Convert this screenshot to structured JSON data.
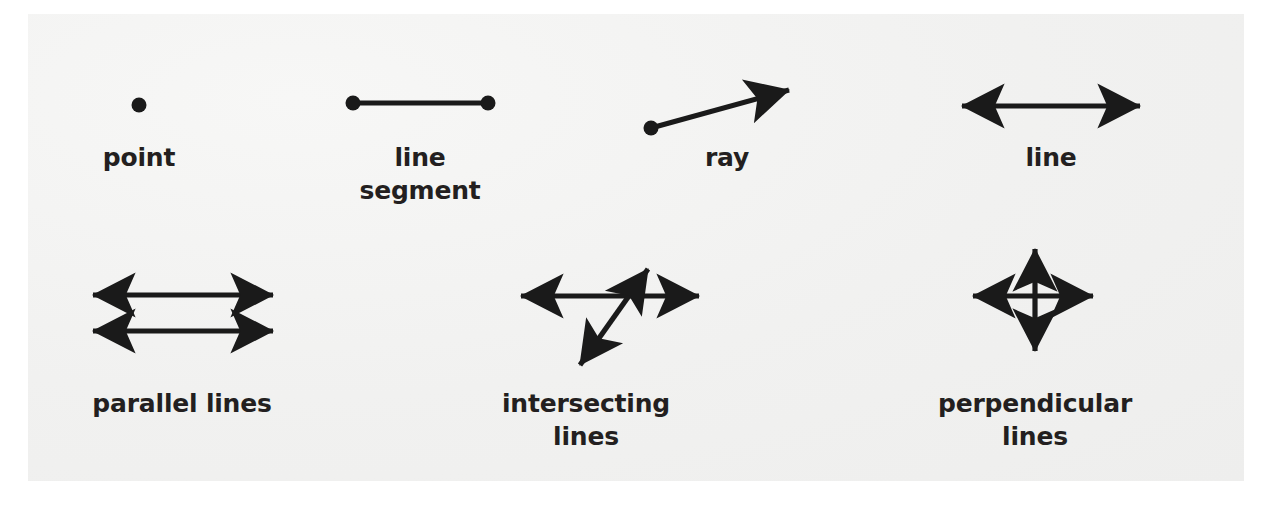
{
  "figure": {
    "background_color": "#f3f3f2",
    "page_color": "#ffffff",
    "ink_color": "#1a1a1a",
    "label_color": "#231f20"
  },
  "items": [
    {
      "id": "point",
      "label_lines": [
        "point"
      ],
      "label_center_x": 139,
      "label_top_y": 144,
      "glyph": "single-dot",
      "dot": {
        "cx": 139,
        "cy": 105,
        "r": 7.5
      }
    },
    {
      "id": "line-segment",
      "label_lines": [
        "line",
        "segment"
      ],
      "label_center_x": 420,
      "label_top_y": 144,
      "glyph": "segment-with-two-endpoints",
      "segment": {
        "x1": 353,
        "y1": 103,
        "x2": 488,
        "y2": 103
      },
      "endpoint_r": 7.5
    },
    {
      "id": "ray",
      "label_lines": [
        "ray"
      ],
      "label_center_x": 727,
      "label_top_y": 144,
      "glyph": "ray-with-one-arrow",
      "segment": {
        "x1": 651,
        "y1": 128,
        "x2": 803,
        "y2": 86
      },
      "endpoint_r": 7.5
    },
    {
      "id": "line",
      "label_lines": [
        "line"
      ],
      "label_center_x": 1051,
      "label_top_y": 144,
      "glyph": "double-arrow-horizontal",
      "segment": {
        "x1": 949,
        "y1": 106,
        "x2": 1153,
        "y2": 106
      }
    },
    {
      "id": "parallel-lines",
      "label_lines": [
        "parallel lines"
      ],
      "label_center_x": 182,
      "label_top_y": 390,
      "glyph": "two-parallel-double-arrows",
      "segments": [
        {
          "x1": 80,
          "y1": 295,
          "x2": 286,
          "y2": 295
        },
        {
          "x1": 80,
          "y1": 331,
          "x2": 286,
          "y2": 331
        }
      ]
    },
    {
      "id": "intersecting-lines",
      "label_lines": [
        "intersecting",
        "lines"
      ],
      "label_center_x": 586,
      "label_top_y": 390,
      "glyph": "two-crossing-double-arrows",
      "segments": [
        {
          "x1": 508,
          "y1": 296,
          "x2": 712,
          "y2": 296
        },
        {
          "x1": 571,
          "y1": 378,
          "x2": 657,
          "y2": 256
        }
      ]
    },
    {
      "id": "perpendicular-lines",
      "label_lines": [
        "perpendicular",
        "lines"
      ],
      "label_center_x": 1035,
      "label_top_y": 390,
      "glyph": "perpendicular-cross-double-arrows",
      "segments": [
        {
          "x1": 960,
          "y1": 296,
          "x2": 1106,
          "y2": 296
        },
        {
          "x1": 1035,
          "y1": 236,
          "x2": 1035,
          "y2": 364
        }
      ]
    }
  ],
  "label_line_height": 33,
  "label_font_size": 25
}
